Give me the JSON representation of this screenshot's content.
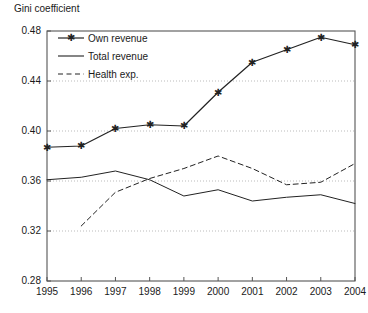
{
  "chart_data": {
    "type": "line",
    "title": "Gini coefficient",
    "xlabel": "",
    "ylabel": "Gini coefficient",
    "categories": [
      "1995",
      "1996",
      "1997",
      "1998",
      "1999",
      "2000",
      "2001",
      "2002",
      "2003",
      "2004"
    ],
    "x": [
      1995,
      1996,
      1997,
      1998,
      1999,
      2000,
      2001,
      2002,
      2003,
      2004
    ],
    "ylim": [
      0.28,
      0.48
    ],
    "xlim": [
      1995,
      2004
    ],
    "yticks": [
      "0.48",
      "0.44",
      "0.40",
      "0.36",
      "0.32",
      "0.28"
    ],
    "ytick_values": [
      0.48,
      0.44,
      0.4,
      0.36,
      0.32,
      0.28
    ],
    "grid": true,
    "grid_axis": "y",
    "legend_position": "top-left",
    "series": [
      {
        "name": "Own revenue",
        "style": "solid-marker",
        "marker": "star",
        "values": [
          0.387,
          0.388,
          0.402,
          0.405,
          0.404,
          0.431,
          0.455,
          0.465,
          0.475,
          0.469
        ]
      },
      {
        "name": "Total revenue",
        "style": "solid",
        "marker": "none",
        "values": [
          0.361,
          0.363,
          0.368,
          0.361,
          0.348,
          0.353,
          0.344,
          0.347,
          0.349,
          0.342
        ]
      },
      {
        "name": "Health exp.",
        "style": "dashed",
        "marker": "none",
        "values": [
          null,
          0.324,
          0.351,
          0.362,
          0.37,
          0.38,
          0.37,
          0.357,
          0.359,
          0.374
        ]
      }
    ]
  },
  "legend": {
    "items": [
      {
        "label": "Own revenue"
      },
      {
        "label": "Total revenue"
      },
      {
        "label": "Health exp."
      }
    ]
  },
  "colors": {
    "line": "#222222",
    "grid": "#aaaaaa",
    "axis": "#555555",
    "background": "#ffffff"
  }
}
